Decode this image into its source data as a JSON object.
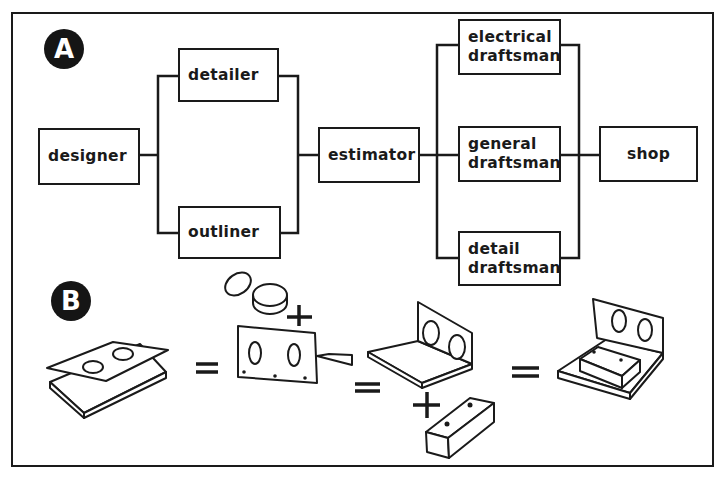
{
  "diagram_a": {
    "label": "A",
    "nodes": {
      "designer": "designer",
      "detailer": "detailer",
      "outliner": "outliner",
      "estimator": "estimator",
      "electrical_l1": "electrical",
      "electrical_l2": "draftsman",
      "general_l1": "general",
      "general_l2": "draftsman",
      "detail_l1": "detail",
      "detail_l2": "draftsman",
      "shop": "shop"
    },
    "flow": [
      [
        "designer",
        "detailer"
      ],
      [
        "designer",
        "outliner"
      ],
      [
        "detailer",
        "estimator"
      ],
      [
        "outliner",
        "estimator"
      ],
      [
        "estimator",
        "electrical draftsman"
      ],
      [
        "estimator",
        "general draftsman"
      ],
      [
        "estimator",
        "detail draftsman"
      ],
      [
        "electrical draftsman",
        "shop"
      ],
      [
        "general draftsman",
        "shop"
      ],
      [
        "detail draftsman",
        "shop"
      ]
    ]
  },
  "diagram_b": {
    "label": "B",
    "sequence": [
      "base plate with separate perforated top plate",
      "=",
      "bent angle plate with two holes + two round bushings",
      "=",
      "angle bracket with bushings + rectangular block",
      "=",
      "completed assembly: angle bracket with bushings and block"
    ],
    "operators": {
      "plus": "+",
      "equals": "="
    }
  }
}
